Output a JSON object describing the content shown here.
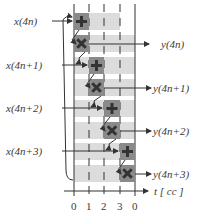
{
  "diagram": {
    "inputs": [
      {
        "label": "x(4n)",
        "y": 17
      },
      {
        "label": "x(4n+1)",
        "y": 61
      },
      {
        "label": "x(4n+2)",
        "y": 104
      },
      {
        "label": "x(4n+3)",
        "y": 147
      }
    ],
    "outputs": [
      {
        "label": "y(4n)",
        "y": 40
      },
      {
        "label": "y(4n+1)",
        "y": 84
      },
      {
        "label": "y(4n+2)",
        "y": 127
      },
      {
        "label": "y(4n+3)",
        "y": 170
      }
    ],
    "axis": {
      "label": "t [ cc ]",
      "ticks": [
        "0",
        "1",
        "2",
        "3",
        "0"
      ]
    },
    "block_icons": {
      "load": "plus-icon",
      "compute": "cross-icon"
    },
    "colors": {
      "dark_block": "#8a8a8a",
      "light_bar": "#dcdcdc",
      "line": "#333333",
      "glyph": "#333333"
    }
  }
}
